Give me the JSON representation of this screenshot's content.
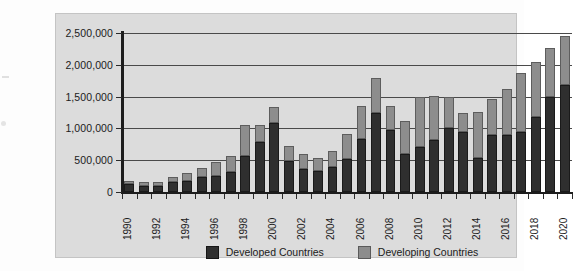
{
  "chart_data": {
    "type": "bar",
    "stacked": true,
    "title": "",
    "xlabel": "",
    "ylabel": "",
    "ylim": [
      0,
      2500000
    ],
    "ytick_values": [
      0,
      500000,
      1000000,
      1500000,
      2000000,
      2500000
    ],
    "ytick_labels": [
      "0",
      "500,000",
      "1,000,000",
      "1,500,000",
      "2,000,000",
      "2,500,000"
    ],
    "grid": true,
    "legend_position": "bottom",
    "categories": [
      "1990",
      "1991",
      "1992",
      "1993",
      "1994",
      "1995",
      "1996",
      "1997",
      "1998",
      "1999",
      "2000",
      "2001",
      "2002",
      "2003",
      "2004",
      "2005",
      "2006",
      "2007",
      "2008",
      "2009",
      "2010",
      "2011",
      "2012",
      "2013",
      "2014",
      "2015",
      "2016",
      "2017",
      "2018",
      "2019",
      "2020"
    ],
    "xtick_labels": [
      "1990",
      "1992",
      "1994",
      "1996",
      "1998",
      "2000",
      "2002",
      "2004",
      "2006",
      "2008",
      "2010",
      "2012",
      "2014",
      "2016",
      "2018",
      "2020"
    ],
    "series": [
      {
        "name": "Developed Countries",
        "color": "#2f2f2f",
        "values": [
          130000,
          95000,
          95000,
          160000,
          175000,
          230000,
          250000,
          320000,
          560000,
          790000,
          1080000,
          480000,
          360000,
          330000,
          400000,
          520000,
          830000,
          1240000,
          980000,
          600000,
          710000,
          820000,
          1010000,
          950000,
          530000,
          900000,
          900000,
          940000,
          1180000,
          1500000,
          1680000
        ]
      },
      {
        "name": "Developing Countries",
        "color": "#8d8d8d",
        "values": [
          45000,
          55000,
          55000,
          75000,
          130000,
          155000,
          215000,
          250000,
          490000,
          270000,
          250000,
          240000,
          245000,
          205000,
          240000,
          400000,
          530000,
          560000,
          370000,
          520000,
          790000,
          690000,
          490000,
          300000,
          730000,
          570000,
          720000,
          930000,
          870000,
          760000,
          770000
        ]
      }
    ]
  },
  "legend": {
    "items": [
      {
        "label": "Developed Countries",
        "color": "#2f2f2f"
      },
      {
        "label": "Developing Countries",
        "color": "#8d8d8d"
      }
    ]
  }
}
